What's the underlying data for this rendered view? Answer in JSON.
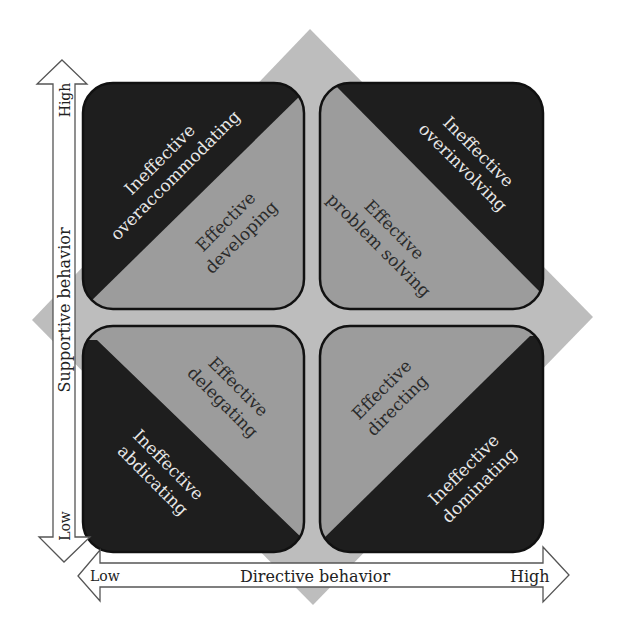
{
  "diagram": {
    "colors": {
      "background": "#ffffff",
      "diamond": "#bdbdbd",
      "ineffective_fill": "#1e1e1e",
      "effective_fill": "#9c9c9c",
      "box_border": "#111111",
      "arrow_fill": "#ffffff",
      "arrow_stroke": "#555555"
    },
    "y_axis": {
      "label": "Supportive behavior",
      "high": "High",
      "low": "Low"
    },
    "x_axis": {
      "label": "Directive behavior",
      "low": "Low",
      "high": "High"
    },
    "quadrants": {
      "top_left": {
        "ineffective": {
          "line1": "Ineffective",
          "line2": "overaccommodating"
        },
        "effective": {
          "line1": "Effective",
          "line2": "developing"
        }
      },
      "top_right": {
        "ineffective": {
          "line1": "Ineffective",
          "line2": "overinvolving"
        },
        "effective": {
          "line1": "Effective",
          "line2": "problem solving"
        }
      },
      "bottom_left": {
        "ineffective": {
          "line1": "Ineffective",
          "line2": "abdicating"
        },
        "effective": {
          "line1": "Effective",
          "line2": "delegating"
        }
      },
      "bottom_right": {
        "ineffective": {
          "line1": "Ineffective",
          "line2": "dominating"
        },
        "effective": {
          "line1": "Effective",
          "line2": "directing"
        }
      }
    }
  }
}
